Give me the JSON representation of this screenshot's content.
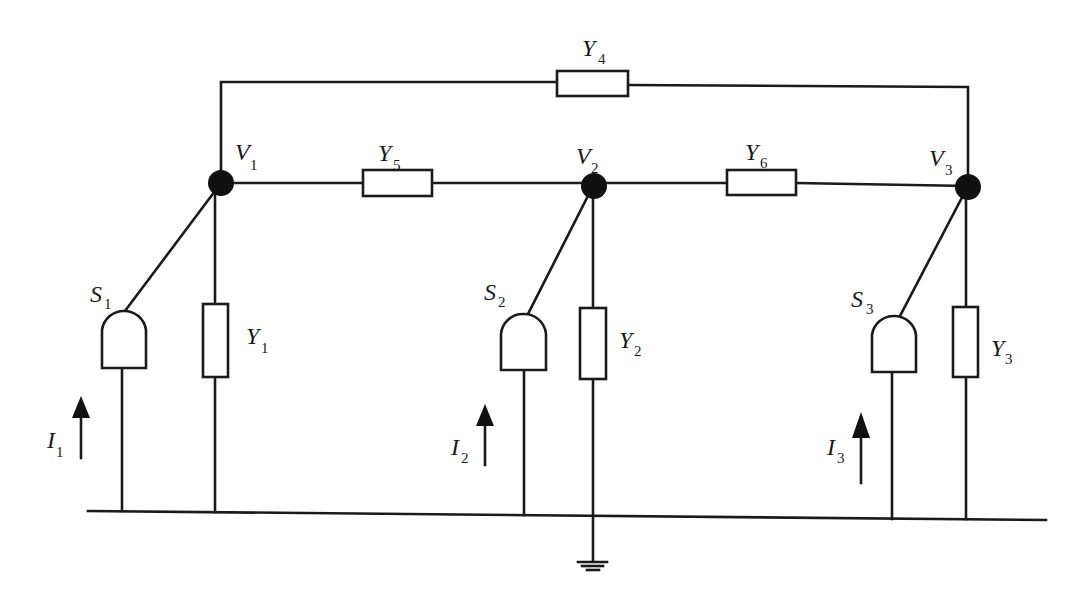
{
  "diagram": {
    "type": "power-network-circuit",
    "nodes": [
      {
        "id": "V1",
        "label": "V",
        "sub": "1"
      },
      {
        "id": "V2",
        "label": "V",
        "sub": "2"
      },
      {
        "id": "V3",
        "label": "V",
        "sub": "3"
      }
    ],
    "admittances": [
      {
        "id": "Y1",
        "label": "Y",
        "sub": "1",
        "between": [
          "V1",
          "ground"
        ]
      },
      {
        "id": "Y2",
        "label": "Y",
        "sub": "2",
        "between": [
          "V2",
          "ground"
        ]
      },
      {
        "id": "Y3",
        "label": "Y",
        "sub": "3",
        "between": [
          "V3",
          "ground"
        ]
      },
      {
        "id": "Y4",
        "label": "Y",
        "sub": "4",
        "between": [
          "V1",
          "V3"
        ]
      },
      {
        "id": "Y5",
        "label": "Y",
        "sub": "5",
        "between": [
          "V1",
          "V2"
        ]
      },
      {
        "id": "Y6",
        "label": "Y",
        "sub": "6",
        "between": [
          "V2",
          "V3"
        ]
      }
    ],
    "sources": [
      {
        "id": "S1",
        "label": "S",
        "sub": "1",
        "node": "V1"
      },
      {
        "id": "S2",
        "label": "S",
        "sub": "2",
        "node": "V2"
      },
      {
        "id": "S3",
        "label": "S",
        "sub": "3",
        "node": "V3"
      }
    ],
    "currents": [
      {
        "id": "I1",
        "label": "I",
        "sub": "1",
        "direction": "up"
      },
      {
        "id": "I2",
        "label": "I",
        "sub": "2",
        "direction": "up"
      },
      {
        "id": "I3",
        "label": "I",
        "sub": "3",
        "direction": "up"
      }
    ],
    "ground": {
      "symbol": "ground-icon",
      "below": "Y2"
    }
  }
}
